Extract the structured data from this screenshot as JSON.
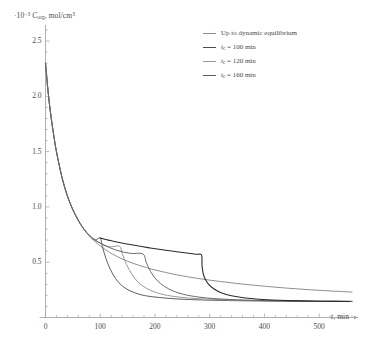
{
  "chart_data": {
    "type": "line",
    "title": "",
    "ylabel_prefix": "·10",
    "ylabel_exponent": "-3",
    "ylabel_symbol": "C",
    "ylabel_subscript": "org",
    "ylabel_units": "mol/cm",
    "ylabel_units_exponent": "3",
    "ylabel_full": "·10⁻³ C_org, mol/cm³",
    "xlabel_symbol": "t",
    "xlabel_units": "min",
    "xlabel_full": "t, min",
    "xlim": [
      0,
      560
    ],
    "ylim": [
      0,
      2.6
    ],
    "xticks": [
      0,
      100,
      200,
      300,
      400,
      500
    ],
    "xtick_labels": [
      "0",
      "100",
      "200",
      "300",
      "400",
      "500"
    ],
    "yticks": [
      0.5,
      1.0,
      1.5,
      2.0,
      2.5
    ],
    "ytick_labels": [
      "0.5",
      "1.0",
      "1.5",
      "2.0",
      "2.5"
    ],
    "minor_ticks": true,
    "grid": false,
    "legend_position": "top-right",
    "series": [
      {
        "name": "Up to dynamic equilibrium",
        "label": "Up to dynamic equilibrium",
        "color": "#8f8f8f",
        "width": 1.0,
        "points": [
          [
            0,
            2.3
          ],
          [
            5,
            2.03
          ],
          [
            10,
            1.82
          ],
          [
            15,
            1.65
          ],
          [
            20,
            1.5
          ],
          [
            30,
            1.27
          ],
          [
            40,
            1.1
          ],
          [
            50,
            0.975
          ],
          [
            60,
            0.878
          ],
          [
            70,
            0.8
          ],
          [
            80,
            0.74
          ],
          [
            90,
            0.69
          ],
          [
            100,
            0.648
          ],
          [
            120,
            0.58
          ],
          [
            140,
            0.53
          ],
          [
            160,
            0.49
          ],
          [
            180,
            0.458
          ],
          [
            200,
            0.43
          ],
          [
            240,
            0.386
          ],
          [
            280,
            0.352
          ],
          [
            320,
            0.325
          ],
          [
            360,
            0.302
          ],
          [
            400,
            0.283
          ],
          [
            440,
            0.266
          ],
          [
            480,
            0.252
          ],
          [
            520,
            0.24
          ],
          [
            560,
            0.23
          ]
        ]
      },
      {
        "name": "t_c = 100 min",
        "label_symbol": "t",
        "label_subscript": "c",
        "label_value": "100",
        "label_units": "min",
        "label": "t_c = 100 min",
        "switch_time": 100,
        "switch_value": 0.72,
        "color": "#4d4d4d",
        "width": 0.9,
        "points": [
          [
            0,
            2.3
          ],
          [
            5,
            2.03
          ],
          [
            10,
            1.82
          ],
          [
            15,
            1.65
          ],
          [
            20,
            1.5
          ],
          [
            30,
            1.27
          ],
          [
            40,
            1.1
          ],
          [
            50,
            0.975
          ],
          [
            60,
            0.878
          ],
          [
            70,
            0.8
          ],
          [
            80,
            0.74
          ],
          [
            90,
            0.7
          ],
          [
            100,
            0.72
          ],
          [
            104,
            0.64
          ],
          [
            110,
            0.54
          ],
          [
            118,
            0.44
          ],
          [
            128,
            0.352
          ],
          [
            140,
            0.286
          ],
          [
            155,
            0.24
          ],
          [
            175,
            0.205
          ],
          [
            200,
            0.185
          ],
          [
            240,
            0.168
          ],
          [
            290,
            0.158
          ],
          [
            350,
            0.152
          ],
          [
            420,
            0.148
          ],
          [
            500,
            0.146
          ],
          [
            560,
            0.145
          ]
        ]
      },
      {
        "name": "t_c = 120 min",
        "label_symbol": "t",
        "label_subscript": "c",
        "label_value": "120",
        "label_units": "min",
        "label": "t_c = 120 min",
        "switch_time": 135,
        "switch_value": 0.645,
        "color": "#9a9a9a",
        "width": 1.0,
        "points": [
          [
            0,
            2.3
          ],
          [
            5,
            2.03
          ],
          [
            10,
            1.82
          ],
          [
            15,
            1.65
          ],
          [
            20,
            1.5
          ],
          [
            30,
            1.27
          ],
          [
            40,
            1.1
          ],
          [
            50,
            0.975
          ],
          [
            60,
            0.878
          ],
          [
            70,
            0.8
          ],
          [
            80,
            0.74
          ],
          [
            95,
            0.685
          ],
          [
            115,
            0.64
          ],
          [
            135,
            0.645
          ],
          [
            140,
            0.58
          ],
          [
            148,
            0.48
          ],
          [
            158,
            0.39
          ],
          [
            170,
            0.316
          ],
          [
            185,
            0.262
          ],
          [
            205,
            0.221
          ],
          [
            230,
            0.194
          ],
          [
            265,
            0.175
          ],
          [
            310,
            0.163
          ],
          [
            370,
            0.155
          ],
          [
            440,
            0.15
          ],
          [
            500,
            0.147
          ],
          [
            560,
            0.146
          ]
        ]
      },
      {
        "name": "t_c = 160 min",
        "label_symbol": "t",
        "label_subscript": "c",
        "label_value": "160",
        "label_units": "min",
        "label": "t_c = 160 min",
        "switch_time": 178,
        "switch_value": 0.575,
        "color": "#5a5a5a",
        "width": 0.9,
        "points": [
          [
            0,
            2.3
          ],
          [
            5,
            2.03
          ],
          [
            10,
            1.82
          ],
          [
            15,
            1.65
          ],
          [
            20,
            1.5
          ],
          [
            30,
            1.27
          ],
          [
            40,
            1.1
          ],
          [
            50,
            0.975
          ],
          [
            60,
            0.878
          ],
          [
            70,
            0.8
          ],
          [
            85,
            0.722
          ],
          [
            105,
            0.66
          ],
          [
            130,
            0.608
          ],
          [
            155,
            0.58
          ],
          [
            178,
            0.575
          ],
          [
            184,
            0.5
          ],
          [
            192,
            0.415
          ],
          [
            203,
            0.34
          ],
          [
            217,
            0.282
          ],
          [
            235,
            0.236
          ],
          [
            258,
            0.203
          ],
          [
            288,
            0.18
          ],
          [
            325,
            0.166
          ],
          [
            375,
            0.156
          ],
          [
            435,
            0.15
          ],
          [
            500,
            0.147
          ],
          [
            560,
            0.146
          ]
        ]
      },
      {
        "name": "dark-plateau-branch",
        "label": "",
        "internal": true,
        "color": "#2b2b2b",
        "width": 1.1,
        "points": [
          [
            100,
            0.718
          ],
          [
            115,
            0.7
          ],
          [
            135,
            0.678
          ],
          [
            160,
            0.655
          ],
          [
            190,
            0.63
          ],
          [
            220,
            0.608
          ],
          [
            250,
            0.588
          ],
          [
            275,
            0.572
          ],
          [
            285,
            0.566
          ],
          [
            286,
            0.47
          ],
          [
            288,
            0.4
          ],
          [
            292,
            0.345
          ],
          [
            298,
            0.3
          ],
          [
            308,
            0.258
          ],
          [
            322,
            0.222
          ],
          [
            340,
            0.196
          ],
          [
            362,
            0.178
          ],
          [
            390,
            0.165
          ],
          [
            425,
            0.156
          ],
          [
            465,
            0.15
          ],
          [
            510,
            0.147
          ],
          [
            556,
            0.145
          ]
        ]
      }
    ]
  },
  "axes": {
    "x_axis_arrow": true,
    "y_axis_arrow": false
  }
}
